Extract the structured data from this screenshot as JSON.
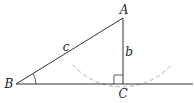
{
  "diagram": {
    "type": "right-triangle-construction",
    "colors": {
      "stroke": "#333333",
      "arc": "#b0b0b0",
      "text": "#222222"
    },
    "vertices": {
      "A": {
        "label": "A",
        "x": 123,
        "y": 18,
        "label_x": 124,
        "label_y": 10
      },
      "B": {
        "label": "B",
        "x": 16,
        "y": 84,
        "label_x": 9,
        "label_y": 84
      },
      "C": {
        "label": "C",
        "x": 123,
        "y": 84,
        "label_x": 123,
        "label_y": 94
      }
    },
    "sides": {
      "c": {
        "label": "c",
        "from": "B",
        "to": "A",
        "label_x": 66,
        "label_y": 47
      },
      "b": {
        "label": "b",
        "from": "A",
        "to": "C",
        "label_x": 129,
        "label_y": 52
      }
    },
    "baseline": {
      "x1": 16,
      "y1": 84,
      "x2": 193,
      "y2": 84
    },
    "right_angle_marker": {
      "at": "C",
      "size": 9
    },
    "angle_marker": {
      "at": "B",
      "radius": 20
    },
    "dashed_arc": {
      "center": "A",
      "start_x": 73,
      "start_y": 65,
      "end_x": 172,
      "end_y": 64
    }
  }
}
